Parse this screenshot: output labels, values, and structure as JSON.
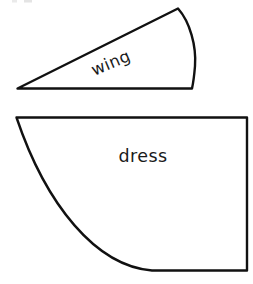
{
  "document": {
    "kind": "sewing-pattern-sheet",
    "background_color": "#ffffff",
    "ink_color": "#111111",
    "width": 253,
    "height": 284
  },
  "pieces": [
    {
      "id": "wing",
      "label": "wing",
      "shape": "curved wedge",
      "label_rotation_deg": -23,
      "label_x": 113,
      "label_y": 68,
      "outline_path": "M 17.5 88.5 L 178 8.5 C 190 22 196.5 46 195 66 C 194.2 76 193.2 83 192 88.5 Z",
      "vertices": {
        "apex_left": [
          17.5,
          88.5
        ],
        "top_point": [
          178,
          8.5
        ],
        "bottom_right": [
          192,
          88.5
        ]
      },
      "stroke_width": 2.4,
      "fill": "#ffffff",
      "stroke": "#111111"
    },
    {
      "id": "dress",
      "label": "dress",
      "shape": "quarter circle sector",
      "label_rotation_deg": 0,
      "label_x": 143,
      "label_y": 162,
      "outline_path": "M 16.5 117.5 L 247 117.5 L 247 270.5 L 152 270.5 C 96 266 46 205 16.5 117.5 Z",
      "vertices": {
        "top_left": [
          16.5,
          117.5
        ],
        "top_right": [
          247,
          117.5
        ],
        "bottom_right": [
          247,
          270.5
        ]
      },
      "stroke_width": 2.4,
      "fill": "#ffffff",
      "stroke": "#111111"
    }
  ],
  "artifacts": {
    "top_edge_mark_visible": true,
    "top_edge_mark_color": "#d8d8d8"
  }
}
